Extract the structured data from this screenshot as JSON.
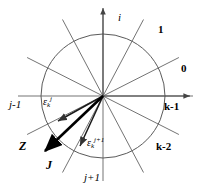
{
  "figure": {
    "type": "diagram",
    "background": "#ffffff",
    "line_color": "#555555",
    "bold_color": "#000000",
    "center": {
      "x": 103,
      "y": 96
    },
    "circle_radius": 62,
    "axes": {
      "imaginary_label": "i",
      "vertical_arrow_tip": {
        "x": 103,
        "y": 5
      },
      "horizontal_arrow_tip": {
        "x": 193,
        "y": 96
      }
    },
    "sector_labels": [
      {
        "id": "sector-1",
        "text": "1",
        "x": 158,
        "y": 30,
        "style": "sector"
      },
      {
        "id": "sector-0",
        "text": "0",
        "x": 181,
        "y": 69,
        "style": "sector"
      },
      {
        "id": "sector-k-1",
        "text": "k-1",
        "x": 164,
        "y": 106,
        "style": "sector"
      },
      {
        "id": "sector-k-2",
        "text": "k-2",
        "x": 156,
        "y": 146,
        "style": "sector"
      },
      {
        "id": "sector-j-1",
        "text": "j-1",
        "x": 11,
        "y": 104,
        "style": "idx"
      },
      {
        "id": "sector-j+1",
        "text": "j+1",
        "x": 84,
        "y": 176,
        "style": "idx"
      }
    ],
    "error_vectors": [
      {
        "id": "epsilon-k-j",
        "symbol": "ε",
        "subscript": "k",
        "superscript": "j",
        "label_x": 44,
        "label_y": 99,
        "from": {
          "x": 103,
          "y": 96
        },
        "to": {
          "x": 57,
          "y": 122
        }
      },
      {
        "id": "epsilon-k-j-plus-1",
        "symbol": "ε",
        "subscript": "k",
        "superscript": "j+1",
        "label_x": 88,
        "label_y": 140,
        "from": {
          "x": 103,
          "y": 96
        },
        "to": {
          "x": 79,
          "y": 147
        }
      }
    ],
    "bold_vectors": [
      {
        "id": "vector-Z",
        "label": "Z",
        "label_x": 21,
        "label_y": 146,
        "from": {
          "x": 103,
          "y": 96
        },
        "to": {
          "x": 44,
          "y": 152
        }
      },
      {
        "id": "vector-J",
        "label": "J",
        "label_x": 47,
        "label_y": 166
      }
    ],
    "spoke_count": 12
  }
}
